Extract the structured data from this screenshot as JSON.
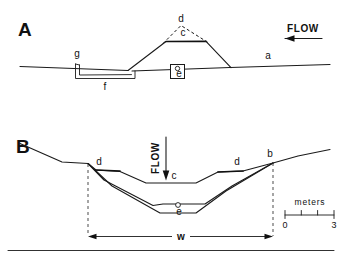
{
  "figure": {
    "panels": [
      {
        "id": "A",
        "letter": "A",
        "view": "longitudinal profile",
        "flow": {
          "label": "FLOW",
          "direction": "left",
          "orientation": "horizontal"
        },
        "labels": [
          {
            "key": "a",
            "text": "a",
            "meaning": "bed surface line"
          },
          {
            "key": "c",
            "text": "c",
            "meaning": "crest of structure"
          },
          {
            "key": "d",
            "text": "d",
            "meaning": "projected original profile (dashed)"
          },
          {
            "key": "e",
            "text": "e",
            "meaning": "instrument station marker"
          },
          {
            "key": "f",
            "text": "f",
            "meaning": "excavated trough"
          },
          {
            "key": "g",
            "text": "g",
            "meaning": "upstream lip of trough"
          }
        ]
      },
      {
        "id": "B",
        "letter": "B",
        "view": "cross section",
        "flow": {
          "label": "FLOW",
          "direction": "down",
          "orientation": "vertical"
        },
        "labels": [
          {
            "key": "b",
            "text": "b",
            "meaning": "bank top"
          },
          {
            "key": "c",
            "text": "c",
            "meaning": "uppermost fill surface"
          },
          {
            "key": "d-left",
            "text": "d",
            "meaning": "left terrace surface"
          },
          {
            "key": "d-right",
            "text": "d",
            "meaning": "right terrace surface"
          },
          {
            "key": "e",
            "text": "e",
            "meaning": "channel thalweg marker"
          },
          {
            "key": "w",
            "text": "w",
            "meaning": "channel width dimension"
          }
        ],
        "scale_bar": {
          "unit_label": "meters",
          "min": "0",
          "max": "3",
          "divisions": 3
        }
      }
    ],
    "colors": {
      "ink": "#111111",
      "paper": "#ffffff"
    }
  }
}
